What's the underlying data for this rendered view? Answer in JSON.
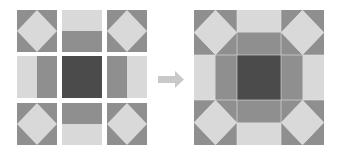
{
  "diagram": {
    "colors": {
      "light": "#d9d9d9",
      "medium": "#8f8f8f",
      "dark": "#4b4b4b",
      "arrow": "#c9c9c9",
      "seam": "#e8e8e8"
    },
    "left_grid": {
      "rows": [
        [
          "diamond-square",
          "strip-light-top-dark-bottom",
          "diamond-square"
        ],
        [
          "strip-light-left-dark-right",
          "dark-center-square",
          "strip-dark-left-light-right"
        ],
        [
          "diamond-square",
          "strip-dark-top-light-bottom",
          "diamond-square"
        ]
      ]
    },
    "arrow": {
      "direction": "right"
    },
    "result": {
      "name": "assembled-quilt-block"
    }
  }
}
